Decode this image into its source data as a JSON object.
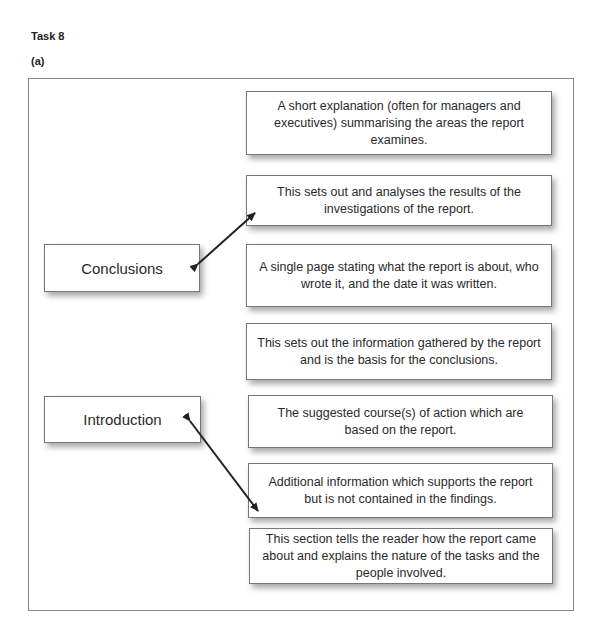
{
  "header": {
    "task_title": "Task 8",
    "part_label": "(a)"
  },
  "terms": [
    {
      "label": "Conclusions"
    },
    {
      "label": "Introduction"
    }
  ],
  "definitions": [
    {
      "text": "A short explanation (often for managers and executives) summarising the areas the report examines."
    },
    {
      "text": "This sets out and analyses the results of the investigations of the report."
    },
    {
      "text": "A single page stating what the report is about, who wrote it, and the date it was written."
    },
    {
      "text": "This sets out the information gathered by the report and is the basis for the conclusions."
    },
    {
      "text": "The suggested course(s) of action which are based on the report."
    },
    {
      "text": "Additional information which supports the report but is not contained in the findings."
    },
    {
      "text": "This section tells the reader how the report came about and explains the nature of the tasks and the people involved."
    }
  ],
  "connections": [
    {
      "from": "Conclusions",
      "to_definition_index": 1
    },
    {
      "from": "Introduction",
      "to_definition_index": 6
    }
  ],
  "colors": {
    "arrow": "#222222",
    "box_border": "#777777",
    "frame_border": "#888888"
  }
}
